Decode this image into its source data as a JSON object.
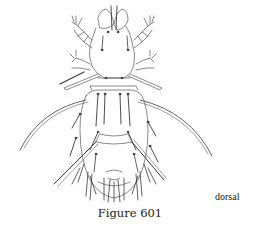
{
  "figure": {
    "caption": "Figure 601",
    "view_label": "dorsal",
    "illustration": "mite-dorsal-line-drawing",
    "line_color": "#3a3a3a",
    "background": "#ffffff"
  }
}
